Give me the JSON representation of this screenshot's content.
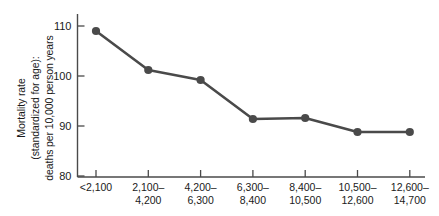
{
  "chart_data": {
    "type": "line",
    "title": "",
    "subtitle": "",
    "xlabel": "",
    "ylabel_lines": [
      "Mortality rate",
      "(standardized for age):",
      "deaths per 10,000 person years"
    ],
    "categories": [
      "<2,100",
      "2,100–4,200",
      "4,200–6,300",
      "6,300–8,400",
      "8,400–10,500",
      "10,500–12,600",
      "12,600–14,700"
    ],
    "category_lines": [
      [
        "<2,100",
        ""
      ],
      [
        "2,100–",
        "4,200"
      ],
      [
        "4,200–",
        "6,300"
      ],
      [
        "6,300–",
        "8,400"
      ],
      [
        "8,400–",
        "10,500"
      ],
      [
        "10,500–",
        "12,600"
      ],
      [
        "12,600–",
        "14,700"
      ]
    ],
    "values": [
      109.0,
      101.2,
      99.2,
      91.4,
      91.6,
      88.8,
      88.8
    ],
    "ylim": [
      80,
      112.5
    ],
    "yticks": [
      80,
      90,
      100,
      110
    ],
    "ytick_labels": [
      "80",
      "90",
      "100",
      "110"
    ],
    "grid": false,
    "legend": false,
    "legend_position": "none",
    "series": [
      {
        "name": "Mortality rate",
        "values": [
          109.0,
          101.2,
          99.2,
          91.4,
          91.6,
          88.8,
          88.8
        ]
      }
    ],
    "colors": {
      "line": "#4a4a4a",
      "marker": "#4a4a4a",
      "axis": "#4a4a4a",
      "text": "#1a1a1a",
      "background": "#ffffff"
    }
  }
}
